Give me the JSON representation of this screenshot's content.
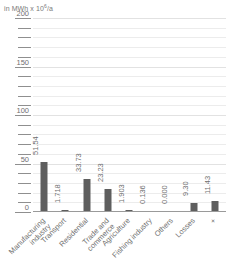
{
  "chart_data": {
    "type": "bar",
    "title": "",
    "subtitle": "",
    "unit_caption": "in MWh x 10",
    "unit_exponent": "6",
    "unit_suffix": "/a",
    "xlabel": "",
    "ylabel": "",
    "ylim": [
      0,
      200
    ],
    "ytick_major": [
      200,
      150,
      100,
      50,
      0
    ],
    "ytick_minor": [
      190,
      180,
      170,
      160,
      140,
      130,
      120,
      110,
      90,
      80,
      70,
      60,
      40,
      30,
      20,
      10
    ],
    "grid": true,
    "legend": "none",
    "bar_color": "#5e5e5e",
    "categories": [
      "Manufacturing\nindustry",
      "Transport",
      "Residential",
      "Trade and\ncommerce",
      "Agriculture",
      "Fishing industry",
      "Others",
      "Losses",
      "+"
    ],
    "values": [
      51.54,
      1.718,
      33.73,
      23.23,
      1.903,
      0.136,
      0.0,
      9.3,
      11.43
    ],
    "value_labels": [
      "51.54",
      "1.718",
      "33.73",
      "23.23",
      "1.903",
      "0.136",
      "0.000",
      "9.30",
      "11.43"
    ]
  }
}
